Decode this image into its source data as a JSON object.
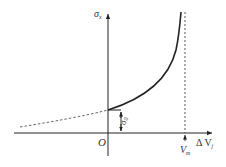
{
  "diagram": {
    "type": "stress-displacement curve",
    "axes": {
      "y_label": "σ",
      "y_label_sub": "x",
      "x_label": "Δ V",
      "x_label_sub": "j",
      "origin_label": "O"
    },
    "annotations": {
      "intercept_label": "σ",
      "intercept_label_sub": "0",
      "asymptote_label": "V",
      "asymptote_label_sub": "m"
    },
    "colors": {
      "line": "#222222",
      "dashed": "#555555",
      "text": "#333333"
    }
  }
}
